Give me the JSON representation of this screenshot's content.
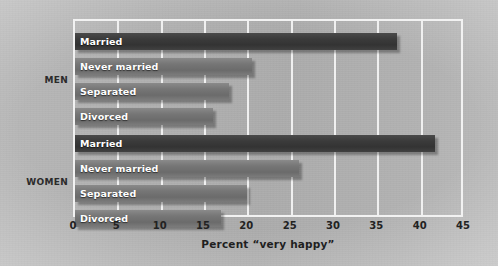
{
  "chart_data": {
    "type": "bar",
    "orientation": "horizontal",
    "title": "",
    "xlabel": "Percent “very happy”",
    "ylabel": "",
    "xlim": [
      0,
      45
    ],
    "xticks": [
      0,
      5,
      10,
      15,
      20,
      25,
      30,
      35,
      40,
      45
    ],
    "xtick_labels": [
      "0",
      "5",
      "10",
      "15",
      "20",
      "25",
      "30",
      "35",
      "40",
      "45"
    ],
    "grid": true,
    "grid_axis": "x",
    "legend": "none",
    "categories": [
      "Married",
      "Never married",
      "Separated",
      "Divorced"
    ],
    "groups": [
      {
        "name": "MEN",
        "label": "MEN",
        "bars": [
          {
            "category": "Married",
            "value": 37.1,
            "style": "dark"
          },
          {
            "category": "Never married",
            "value": 20.4,
            "style": "light"
          },
          {
            "category": "Separated",
            "value": 17.8,
            "style": "light"
          },
          {
            "category": "Divorced",
            "value": 15.9,
            "style": "light"
          }
        ]
      },
      {
        "name": "WOMEN",
        "label": "WOMEN",
        "bars": [
          {
            "category": "Married",
            "value": 41.5,
            "style": "dark"
          },
          {
            "category": "Never married",
            "value": 25.8,
            "style": "light"
          },
          {
            "category": "Separated",
            "value": 19.9,
            "style": "light"
          },
          {
            "category": "Divorced",
            "value": 16.8,
            "style": "light"
          }
        ]
      }
    ],
    "colors": {
      "bar_dark": "#3b3b3b",
      "bar_light": "#767676",
      "gridline": "#f0f0f0",
      "frame": "#f2f2f2",
      "background": "#b2b2b2",
      "bar_label_text": "#ffffff",
      "axis_text": "#222222"
    }
  }
}
